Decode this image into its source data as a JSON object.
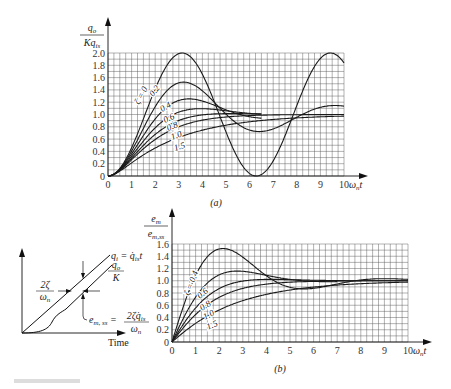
{
  "chart_data": [
    {
      "id": "a",
      "type": "line",
      "title": "",
      "panel_label": "(a)",
      "xlabel": "ω_n t",
      "ylabel_num": "q_o",
      "ylabel_den": "Kq_is",
      "xlim": [
        0,
        10
      ],
      "ylim": [
        0,
        2.0
      ],
      "xticks": [
        "0",
        "1",
        "2",
        "3",
        "4",
        "5",
        "6",
        "7",
        "8",
        "9",
        "10"
      ],
      "yticks": [
        "0",
        "0.2",
        "0.4",
        "0.6",
        "0.8",
        "1.0",
        "1.2",
        "1.4",
        "1.6",
        "1.8",
        "2.0"
      ],
      "grid": true,
      "response": "step",
      "series": [
        {
          "name": "ζ = 0",
          "zeta": 0,
          "x_end": 10,
          "peak": {
            "x": 3.14,
            "y": 2.0
          }
        },
        {
          "name": "0.2",
          "zeta": 0.2,
          "x_end": 10,
          "peak": {
            "x": 3.2,
            "y": 1.53
          }
        },
        {
          "name": "0.4",
          "zeta": 0.4,
          "x_end": 6.5,
          "peak": {
            "x": 3.43,
            "y": 1.25
          }
        },
        {
          "name": "0.6",
          "zeta": 0.6,
          "x_end": 6.5,
          "peak": {
            "x": 3.93,
            "y": 1.09
          }
        },
        {
          "name": "0.8",
          "zeta": 0.8,
          "x_end": 6.5,
          "peak": {
            "x": 5.24,
            "y": 1.015
          }
        },
        {
          "name": "1.0",
          "zeta": 1.0,
          "x_end": 10,
          "final": 1.0
        },
        {
          "name": "1.5",
          "zeta": 1.5,
          "x_end": 10,
          "final": 1.0
        }
      ]
    },
    {
      "id": "b",
      "type": "line",
      "title": "",
      "panel_label": "(b)",
      "xlabel": "ω_n t",
      "ylabel_num": "e_m",
      "ylabel_den": "e_m,ss",
      "xlim": [
        0,
        10
      ],
      "ylim": [
        0,
        1.6
      ],
      "xticks": [
        "0",
        "1",
        "2",
        "3",
        "4",
        "5",
        "6",
        "7",
        "8",
        "9",
        "10"
      ],
      "yticks": [
        "0",
        "0.2",
        "0.4",
        "0.6",
        "0.8",
        "1.0",
        "1.2",
        "1.4",
        "1.6"
      ],
      "grid": true,
      "response": "ramp-error",
      "series": [
        {
          "name": "ζ = 0.4",
          "zeta": 0.4,
          "x_end": 10,
          "peak": {
            "x": 2.2,
            "y": 1.5
          }
        },
        {
          "name": "0.6",
          "zeta": 0.6,
          "x_end": 7,
          "peak": {
            "x": 2.9,
            "y": 1.16
          }
        },
        {
          "name": "0.8",
          "zeta": 0.8,
          "x_end": 10,
          "peak": {
            "x": 4.0,
            "y": 1.03
          }
        },
        {
          "name": "1.0",
          "zeta": 1.0,
          "x_end": 10,
          "final": 1.0
        },
        {
          "name": "1.5",
          "zeta": 1.5,
          "x_end": 10,
          "final": 1.0
        }
      ]
    }
  ],
  "inset": {
    "x_axis_label": "Time",
    "input_label": "q_i = q̇_is t",
    "output_label_num": "q_o",
    "output_label_den": "K",
    "lag_label_num": "2ζ",
    "lag_label_den": "ω_n",
    "error_label": "e_m,ss",
    "error_eq_num": "2ζq̇_is",
    "error_eq_den": "ω_n"
  },
  "caption": ""
}
